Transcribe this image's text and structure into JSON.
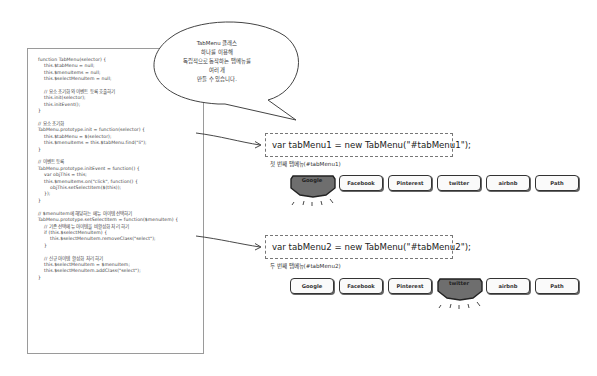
{
  "code_panel": {
    "lines": [
      "function TabMenu(selector) {",
      "    this.$tabMenu = null;",
      "    this.$menuItems = null;",
      "    this.$selectMenuItem = null;",
      "",
      "    // 요소 초기화와 이벤트 등록 호출하기",
      "    this.init(selector);",
      "    this.initEvent();",
      "}",
      "",
      "// 요소 초기화",
      "TabMenu.prototype.init = function(selector) {",
      "    this.$tabMenu = $(selector);",
      "    this.$menuItems = this.$tabMenu.find(\"li\");",
      "}",
      "",
      "// 이벤트 등록",
      "TabMenu.prototype.initEvent = function() {",
      "    var objThis = this;",
      "    this.$menuItems.on(\"click\", function() {",
      "        objThis.setSelectItem($(this));",
      "    });",
      "}",
      "",
      "// $menuItem에 해당하는 메뉴 아이템 선택하기",
      "TabMenu.prototype.setSelectItem = function($menuItem) {",
      "    // 기존 선택메뉴 아이템을 비활성화 처리 하기",
      "    if (this.$selectMenuItem) {",
      "        this.$selectMenuItem.removeClass(\"select\");",
      "    }",
      "",
      "    // 신규 아이템 활성화 처리 하기",
      "    this.$selectMenuItem = $menuItem;",
      "    this.$selectMenuItem.addClass(\"select\");",
      "}"
    ]
  },
  "speech_bubble": {
    "lines": [
      "TabMenu 클래스",
      "하나를 이용해",
      "독립적으로 동작하는 탭메뉴를",
      "여러 개",
      "만들 수 있습니다."
    ]
  },
  "instances": [
    {
      "declaration": "var tabMenu1 = new TabMenu(\"#tabMenu1\");",
      "caption": "첫 번째 탭메뉴(#tabMenu1)",
      "selected_index": 0,
      "tabs": [
        "Google",
        "Facebook",
        "Pinterest",
        "twitter",
        "airbnb",
        "Path"
      ]
    },
    {
      "declaration": "var tabMenu2 = new TabMenu(\"#tabMenu2\");",
      "caption": "두 번째 탭메뉴(#tabMenu2)",
      "selected_index": 3,
      "tabs": [
        "Google",
        "Facebook",
        "Pinterest",
        "twitter",
        "airbnb",
        "Path"
      ]
    }
  ],
  "colors": {
    "selected_tab_fill": "#6e6e6e",
    "tab_border": "#333333",
    "code_border": "#9a9a9a",
    "dashed_border": "#777777"
  }
}
